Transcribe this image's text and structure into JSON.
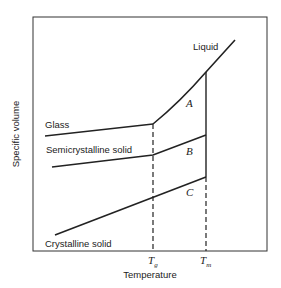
{
  "diagram": {
    "title": "",
    "x_axis_label": "Temperature",
    "y_axis_label": "Specific volume",
    "ticks": {
      "tg": {
        "main": "T",
        "sub": "g"
      },
      "tm": {
        "main": "T",
        "sub": "m"
      }
    },
    "curve_labels": {
      "liquid": "Liquid",
      "glass": "Glass",
      "semicrystalline": "Semicrystalline solid",
      "crystalline": "Crystalline solid"
    },
    "region_labels": {
      "a": "A",
      "b": "B",
      "c": "C"
    },
    "colors": {
      "line": "#222222",
      "frame": "#333333",
      "background": "#ffffff"
    }
  }
}
